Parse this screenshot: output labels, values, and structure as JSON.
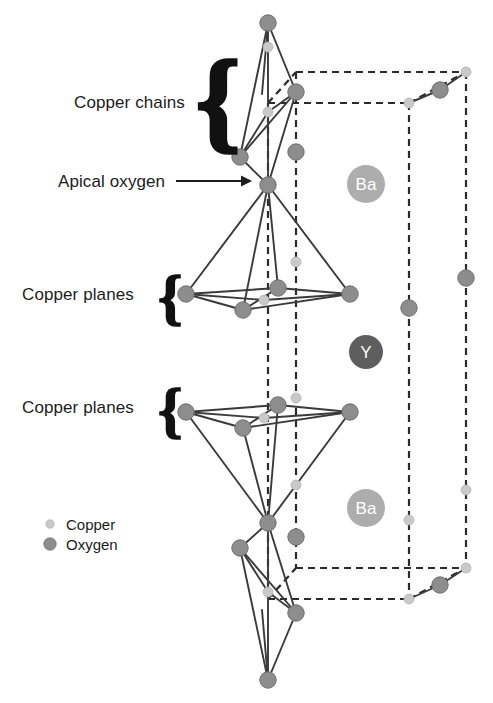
{
  "figure": {
    "background": "#ffffff"
  },
  "annotations": [
    {
      "id": "copper-chains",
      "text": "Copper chains",
      "x": 74,
      "y": 101,
      "brace": "big",
      "brace_x": 196,
      "brace_y": 56
    },
    {
      "id": "apical-oxygen",
      "text": "Apical oxygen",
      "x": 58,
      "y": 180,
      "arrow": true
    },
    {
      "id": "copper-planes-upper",
      "text": "Copper planes",
      "x": 22,
      "y": 293,
      "brace": "small",
      "brace_x": 158,
      "brace_y": 268
    },
    {
      "id": "copper-planes-lower",
      "text": "Copper planes",
      "x": 22,
      "y": 406,
      "brace": "small",
      "brace_x": 158,
      "brace_y": 381
    }
  ],
  "arrow": {
    "x1": 176,
    "y1": 181,
    "x2": 252,
    "y2": 181,
    "color": "#1c1c1c"
  },
  "legend": {
    "items": [
      {
        "label": "Copper",
        "color": "#c9c9c9",
        "r": 4.2,
        "x": 50,
        "y": 524,
        "text_x": 66,
        "text_y": 529
      },
      {
        "label": "Oxygen",
        "color": "#8d8d8d",
        "r": 6.2,
        "x": 50,
        "y": 544,
        "text_x": 66,
        "text_y": 549
      }
    ]
  },
  "ion_labels": [
    {
      "label": "Ba",
      "x": 366,
      "y": 184,
      "r": 19,
      "fill": "#adadad",
      "text_color": "#ffffff",
      "font_size": 17
    },
    {
      "label": "Y",
      "x": 366,
      "y": 352,
      "r": 17,
      "fill": "#5e5e5e",
      "text_color": "#ffffff",
      "font_size": 17
    },
    {
      "label": "Ba",
      "x": 366,
      "y": 508,
      "r": 19,
      "fill": "#adadad",
      "text_color": "#ffffff",
      "font_size": 17
    }
  ],
  "colors": {
    "copper": "#c9c9c9",
    "copper_stroke": "#b4b4b4",
    "oxygen": "#8d8d8d",
    "oxygen_stroke": "#6f6f6f",
    "bond": "#3a3a3a",
    "cell_dash": "#2b2b2b",
    "text": "#1c1c1c"
  },
  "atom_radii": {
    "copper": 5.0,
    "oxygen": 8.2
  },
  "cell_edges": [
    {
      "name": "top-front-horizontal",
      "x1": 268,
      "y1": 103,
      "x2": 409,
      "y2": 103
    },
    {
      "name": "top-back-horizontal",
      "x1": 296,
      "y1": 72,
      "x2": 466,
      "y2": 72
    },
    {
      "name": "top-left-diagonal",
      "x1": 268,
      "y1": 103,
      "x2": 296,
      "y2": 72
    },
    {
      "name": "top-right-diagonal",
      "x1": 409,
      "y1": 103,
      "x2": 466,
      "y2": 72
    },
    {
      "name": "bottom-front-horizontal",
      "x1": 268,
      "y1": 599,
      "x2": 409,
      "y2": 599
    },
    {
      "name": "bottom-back-horizontal",
      "x1": 296,
      "y1": 568,
      "x2": 466,
      "y2": 568
    },
    {
      "name": "bottom-left-diagonal",
      "x1": 268,
      "y1": 599,
      "x2": 296,
      "y2": 568
    },
    {
      "name": "bottom-right-diagonal",
      "x1": 409,
      "y1": 599,
      "x2": 466,
      "y2": 568
    },
    {
      "name": "vertical-front-left",
      "x1": 268,
      "y1": 103,
      "x2": 268,
      "y2": 599
    },
    {
      "name": "vertical-front-right",
      "x1": 409,
      "y1": 103,
      "x2": 409,
      "y2": 599
    },
    {
      "name": "vertical-back-left",
      "x1": 296,
      "y1": 72,
      "x2": 296,
      "y2": 568
    },
    {
      "name": "vertical-back-right",
      "x1": 466,
      "y1": 72,
      "x2": 466,
      "y2": 568
    }
  ],
  "bonds": [
    {
      "x1": 268,
      "y1": 23,
      "x2": 268,
      "y2": 185
    },
    {
      "x1": 268,
      "y1": 23,
      "x2": 262,
      "y2": 94
    },
    {
      "x1": 268,
      "y1": 23,
      "x2": 240,
      "y2": 157
    },
    {
      "x1": 268,
      "y1": 23,
      "x2": 296,
      "y2": 92
    },
    {
      "x1": 240,
      "y1": 157,
      "x2": 268,
      "y2": 185
    },
    {
      "x1": 296,
      "y1": 92,
      "x2": 268,
      "y2": 185
    },
    {
      "x1": 240,
      "y1": 157,
      "x2": 296,
      "y2": 92
    },
    {
      "x1": 240,
      "y1": 157,
      "x2": 268,
      "y2": 112
    },
    {
      "x1": 268,
      "y1": 112,
      "x2": 296,
      "y2": 92
    },
    {
      "x1": 268,
      "y1": 185,
      "x2": 186,
      "y2": 294
    },
    {
      "x1": 268,
      "y1": 185,
      "x2": 350,
      "y2": 294
    },
    {
      "x1": 268,
      "y1": 185,
      "x2": 243,
      "y2": 310
    },
    {
      "x1": 268,
      "y1": 185,
      "x2": 278,
      "y2": 288
    },
    {
      "x1": 186,
      "y1": 294,
      "x2": 243,
      "y2": 310
    },
    {
      "x1": 243,
      "y1": 310,
      "x2": 350,
      "y2": 294
    },
    {
      "x1": 186,
      "y1": 294,
      "x2": 278,
      "y2": 288
    },
    {
      "x1": 278,
      "y1": 288,
      "x2": 350,
      "y2": 294
    },
    {
      "x1": 243,
      "y1": 310,
      "x2": 278,
      "y2": 288
    },
    {
      "x1": 186,
      "y1": 294,
      "x2": 264,
      "y2": 300
    },
    {
      "x1": 264,
      "y1": 300,
      "x2": 350,
      "y2": 294
    },
    {
      "x1": 268,
      "y1": 523,
      "x2": 186,
      "y2": 412
    },
    {
      "x1": 268,
      "y1": 523,
      "x2": 350,
      "y2": 412
    },
    {
      "x1": 268,
      "y1": 523,
      "x2": 243,
      "y2": 428
    },
    {
      "x1": 268,
      "y1": 523,
      "x2": 278,
      "y2": 405
    },
    {
      "x1": 186,
      "y1": 412,
      "x2": 243,
      "y2": 428
    },
    {
      "x1": 243,
      "y1": 428,
      "x2": 350,
      "y2": 412
    },
    {
      "x1": 186,
      "y1": 412,
      "x2": 278,
      "y2": 405
    },
    {
      "x1": 278,
      "y1": 405,
      "x2": 350,
      "y2": 412
    },
    {
      "x1": 243,
      "y1": 428,
      "x2": 278,
      "y2": 405
    },
    {
      "x1": 186,
      "y1": 412,
      "x2": 264,
      "y2": 418
    },
    {
      "x1": 264,
      "y1": 418,
      "x2": 350,
      "y2": 412
    },
    {
      "x1": 268,
      "y1": 523,
      "x2": 268,
      "y2": 680
    },
    {
      "x1": 268,
      "y1": 680,
      "x2": 262,
      "y2": 610
    },
    {
      "x1": 268,
      "y1": 680,
      "x2": 240,
      "y2": 548
    },
    {
      "x1": 268,
      "y1": 680,
      "x2": 296,
      "y2": 613
    },
    {
      "x1": 268,
      "y1": 523,
      "x2": 240,
      "y2": 548
    },
    {
      "x1": 268,
      "y1": 523,
      "x2": 296,
      "y2": 613
    },
    {
      "x1": 240,
      "y1": 548,
      "x2": 296,
      "y2": 613
    },
    {
      "x1": 240,
      "y1": 548,
      "x2": 268,
      "y2": 592
    },
    {
      "x1": 268,
      "y1": 592,
      "x2": 296,
      "y2": 613
    },
    {
      "x1": 409,
      "y1": 103,
      "x2": 440,
      "y2": 90
    },
    {
      "x1": 440,
      "y1": 90,
      "x2": 466,
      "y2": 72
    },
    {
      "x1": 409,
      "y1": 599,
      "x2": 440,
      "y2": 585
    },
    {
      "x1": 440,
      "y1": 585,
      "x2": 466,
      "y2": 568
    }
  ],
  "atoms": [
    {
      "el": "O",
      "x": 268,
      "y": 23
    },
    {
      "el": "O",
      "x": 296,
      "y": 92
    },
    {
      "el": "Cu",
      "x": 268,
      "y": 112
    },
    {
      "el": "O",
      "x": 240,
      "y": 157
    },
    {
      "el": "O",
      "x": 268,
      "y": 185
    },
    {
      "el": "O",
      "x": 186,
      "y": 294
    },
    {
      "el": "O",
      "x": 243,
      "y": 310
    },
    {
      "el": "O",
      "x": 350,
      "y": 294
    },
    {
      "el": "O",
      "x": 278,
      "y": 288
    },
    {
      "el": "Cu",
      "x": 264,
      "y": 300
    },
    {
      "el": "Cu",
      "x": 296,
      "y": 262
    },
    {
      "el": "O",
      "x": 186,
      "y": 412
    },
    {
      "el": "O",
      "x": 243,
      "y": 428
    },
    {
      "el": "O",
      "x": 350,
      "y": 412
    },
    {
      "el": "O",
      "x": 278,
      "y": 405
    },
    {
      "el": "Cu",
      "x": 264,
      "y": 418
    },
    {
      "el": "Cu",
      "x": 296,
      "y": 398
    },
    {
      "el": "O",
      "x": 268,
      "y": 523
    },
    {
      "el": "O",
      "x": 240,
      "y": 548
    },
    {
      "el": "Cu",
      "x": 268,
      "y": 592
    },
    {
      "el": "O",
      "x": 296,
      "y": 613
    },
    {
      "el": "O",
      "x": 268,
      "y": 680
    },
    {
      "el": "Cu",
      "x": 409,
      "y": 103
    },
    {
      "el": "Cu",
      "x": 466,
      "y": 72
    },
    {
      "el": "O",
      "x": 440,
      "y": 90
    },
    {
      "el": "Cu",
      "x": 409,
      "y": 599
    },
    {
      "el": "Cu",
      "x": 466,
      "y": 568
    },
    {
      "el": "O",
      "x": 440,
      "y": 585
    },
    {
      "el": "O",
      "x": 296,
      "y": 152
    },
    {
      "el": "O",
      "x": 409,
      "y": 308
    },
    {
      "el": "O",
      "x": 466,
      "y": 278
    },
    {
      "el": "O",
      "x": 296,
      "y": 537
    },
    {
      "el": "Cu",
      "x": 268,
      "y": 47
    },
    {
      "el": "Cu",
      "x": 296,
      "y": 485
    },
    {
      "el": "Cu",
      "x": 409,
      "y": 520
    },
    {
      "el": "Cu",
      "x": 466,
      "y": 490
    }
  ]
}
